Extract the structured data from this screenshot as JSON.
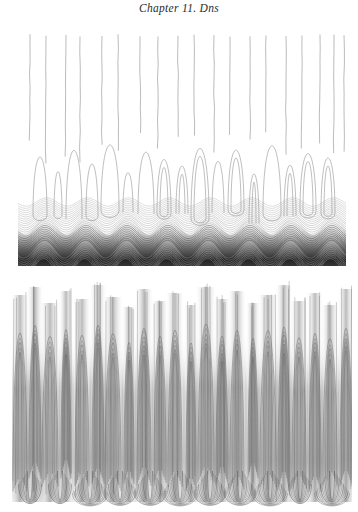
{
  "page": {
    "running_head": "Chapter 11. Dns",
    "background_color": "#ffffff",
    "width": 358,
    "height": 512
  },
  "figures": [
    {
      "id": "figure-top",
      "name": "dns-contour-plot-top",
      "x": 18,
      "y": 34,
      "width": 328,
      "height": 232,
      "description": "Contour plot: near-vertical contour lines in upper region, elongated closed loops and arches in mid region, dense wavy horizontal contour bands forming a dark wave-like layer at the bottom",
      "contour_color": "#8c8c8c",
      "dark_band_color": "#1c1c1c",
      "regions": {
        "vertical_lines": {
          "y_start": 0,
          "y_end": 120,
          "count": 19,
          "x_positions": [
            12,
            28,
            48,
            62,
            84,
            100,
            122,
            140,
            160,
            176,
            196,
            212,
            232,
            248,
            268,
            284,
            302,
            316,
            326
          ]
        },
        "loops": {
          "y_start": 100,
          "y_end": 185,
          "count": 17,
          "x_centers": [
            22,
            40,
            56,
            74,
            92,
            110,
            128,
            146,
            164,
            182,
            200,
            218,
            236,
            254,
            272,
            290,
            310
          ],
          "half_widths": [
            7,
            4,
            8,
            6,
            9,
            5,
            8,
            7,
            6,
            9,
            6,
            8,
            5,
            9,
            6,
            8,
            7
          ],
          "top_ys": [
            112,
            128,
            104,
            120,
            100,
            132,
            108,
            116,
            124,
            102,
            118,
            106,
            130,
            100,
            122,
            110,
            114
          ]
        },
        "wavy_band": {
          "y_start": 160,
          "y_end": 232,
          "wave_count": 8,
          "wave_amplitude": 7,
          "line_count": 34,
          "dark_core_y": 208
        }
      }
    },
    {
      "id": "figure-bottom",
      "name": "dns-contour-plot-bottom",
      "x": 12,
      "y": 277,
      "width": 340,
      "height": 235,
      "description": "Contour plot: dense array of nested arch-shaped and vertically elongated closed contours forming vertical striped structures across the full width, with U-shaped nested feet along the bottom edge",
      "contour_color": "#6e6e6e",
      "shade_color": "#9a9a9a",
      "regions": {
        "columns": {
          "count": 22,
          "x_centers": [
            8,
            23,
            38,
            54,
            70,
            86,
            101,
            117,
            132,
            148,
            163,
            179,
            194,
            210,
            225,
            241,
            256,
            272,
            287,
            303,
            318,
            334
          ],
          "nest_counts": [
            5,
            6,
            5,
            7,
            5,
            6,
            6,
            5,
            7,
            5,
            6,
            5,
            6,
            7,
            5,
            6,
            5,
            7,
            5,
            6,
            5,
            6
          ],
          "arch_top_ys": [
            14,
            6,
            22,
            10,
            18,
            4,
            16,
            26,
            8,
            20,
            12,
            24,
            6,
            18,
            10,
            22,
            14,
            4,
            20,
            12,
            24,
            8
          ],
          "half_widths": [
            7,
            6,
            8,
            5,
            7,
            6,
            8,
            5,
            7,
            6,
            7,
            5,
            8,
            6,
            7,
            5,
            8,
            6,
            7,
            6,
            7,
            6
          ]
        },
        "feet": {
          "y_start": 190,
          "y_end": 235,
          "count": 11,
          "x_centers": [
            18,
            48,
            78,
            108,
            138,
            168,
            198,
            228,
            258,
            288,
            320
          ]
        }
      }
    }
  ]
}
